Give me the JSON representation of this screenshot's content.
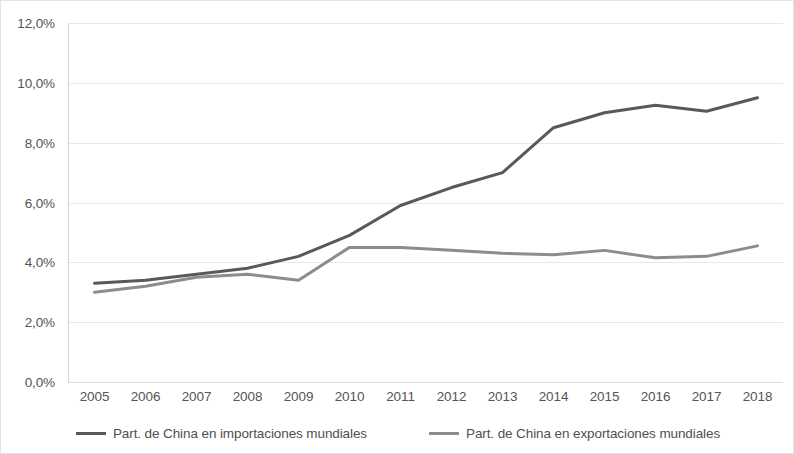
{
  "chart_data": {
    "type": "line",
    "title": "",
    "subtitle": "",
    "xlabel": "",
    "ylabel": "",
    "categories": [
      "2005",
      "2006",
      "2007",
      "2008",
      "2009",
      "2010",
      "2011",
      "2012",
      "2013",
      "2014",
      "2015",
      "2016",
      "2017",
      "2018"
    ],
    "series": [
      {
        "name": "Part. de China en importaciones mundiales",
        "color": "#595959",
        "values": [
          3.3,
          3.4,
          3.6,
          3.8,
          4.2,
          4.9,
          5.9,
          6.5,
          7.0,
          8.5,
          9.0,
          9.25,
          9.05,
          9.5
        ]
      },
      {
        "name": "Part. de China en exportaciones mundiales",
        "color": "#8c8c8c",
        "values": [
          3.0,
          3.2,
          3.5,
          3.6,
          3.4,
          4.5,
          4.5,
          4.4,
          4.3,
          4.25,
          4.4,
          4.15,
          4.2,
          4.55
        ]
      }
    ],
    "ylim": [
      0,
      12
    ],
    "y_ticks": [
      0,
      2,
      4,
      6,
      8,
      10,
      12
    ],
    "y_tick_labels": [
      "0,0%",
      "2,0%",
      "4,0%",
      "6,0%",
      "8,0%",
      "10,0%",
      "12,0%"
    ],
    "grid": true,
    "grid_axis": "y",
    "legend_position": "bottom",
    "value_suffix": "%",
    "decimal_separator": ","
  },
  "legend": {
    "entries": [
      {
        "label": "Part. de China en importaciones mundiales",
        "swatch_name": "legend-swatch-imports"
      },
      {
        "label": "Part. de China en exportaciones mundiales",
        "swatch_name": "legend-swatch-exports"
      }
    ]
  },
  "colors": {
    "imports_line": "#595959",
    "exports_line": "#8c8c8c",
    "gridline": "#e8e8e8",
    "axis_line": "#d2d2d2",
    "border": "#e3e3e3",
    "tick_text": "#555555"
  }
}
